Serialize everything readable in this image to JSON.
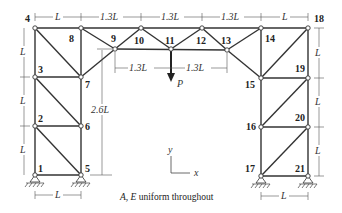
{
  "diagram": {
    "type": "truss",
    "caption_prefix": "A, E",
    "caption_suffix": " uniform throughout",
    "load": {
      "label": "P",
      "node": 11,
      "direction": "down"
    },
    "axes": {
      "x_label": "x",
      "y_label": "y"
    },
    "nodes": [
      {
        "id": "1",
        "x": 35,
        "y": 175
      },
      {
        "id": "2",
        "x": 35,
        "y": 126
      },
      {
        "id": "3",
        "x": 35,
        "y": 77
      },
      {
        "id": "4",
        "x": 35,
        "y": 28
      },
      {
        "id": "5",
        "x": 81,
        "y": 175
      },
      {
        "id": "6",
        "x": 81,
        "y": 126
      },
      {
        "id": "7",
        "x": 81,
        "y": 77
      },
      {
        "id": "8",
        "x": 81,
        "y": 28
      },
      {
        "id": "9",
        "x": 115,
        "y": 49
      },
      {
        "id": "10",
        "x": 141,
        "y": 28
      },
      {
        "id": "11",
        "x": 171,
        "y": 49
      },
      {
        "id": "12",
        "x": 202,
        "y": 28
      },
      {
        "id": "13",
        "x": 227,
        "y": 50
      },
      {
        "id": "14",
        "x": 261,
        "y": 28
      },
      {
        "id": "15",
        "x": 261,
        "y": 78
      },
      {
        "id": "16",
        "x": 261,
        "y": 127
      },
      {
        "id": "17",
        "x": 261,
        "y": 176
      },
      {
        "id": "18",
        "x": 308,
        "y": 28
      },
      {
        "id": "19",
        "x": 308,
        "y": 78
      },
      {
        "id": "20",
        "x": 308,
        "y": 127
      },
      {
        "id": "21",
        "x": 308,
        "y": 176
      }
    ],
    "supports": [
      "1",
      "5",
      "17",
      "21"
    ],
    "dimensions": {
      "top": [
        "L",
        "1.3L",
        "1.3L",
        "1.3L",
        "L"
      ],
      "mid": [
        "1.3L",
        "1.3L"
      ],
      "left": [
        "L",
        "L",
        "L"
      ],
      "right": [
        "L",
        "L",
        "L"
      ],
      "height": "2.6L",
      "bottom_left": "L",
      "bottom_right": "L"
    }
  }
}
